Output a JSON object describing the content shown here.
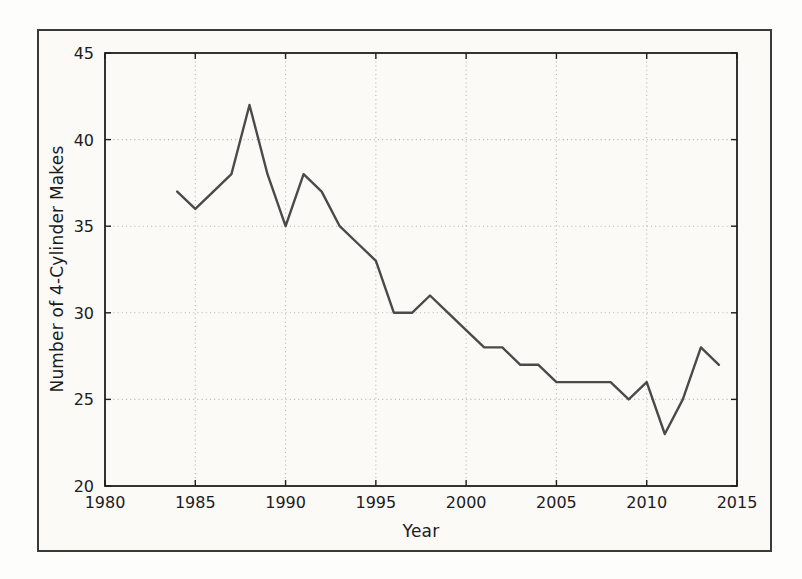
{
  "figure": {
    "page_color": "#fdfdfc",
    "paper_color": "#fbfaf7",
    "frame_color": "#3a3a3a"
  },
  "chart_data": {
    "type": "line",
    "title": "",
    "xlabel": "Year",
    "ylabel": "Number of 4-Cylinder Makes",
    "x": [
      1984,
      1985,
      1986,
      1987,
      1988,
      1989,
      1990,
      1991,
      1992,
      1993,
      1994,
      1995,
      1996,
      1997,
      1998,
      1999,
      2000,
      2001,
      2002,
      2003,
      2004,
      2005,
      2006,
      2007,
      2008,
      2009,
      2010,
      2011,
      2012,
      2013,
      2014
    ],
    "values": [
      37,
      36,
      37,
      38,
      42,
      38,
      35,
      38,
      37,
      35,
      34,
      33,
      30,
      30,
      31,
      30,
      29,
      28,
      28,
      27,
      27,
      26,
      26,
      26,
      26,
      25,
      26,
      23,
      25,
      28,
      27
    ],
    "xlim": [
      1980,
      2015
    ],
    "ylim": [
      20,
      45
    ],
    "xticks": [
      1980,
      1985,
      1990,
      1995,
      2000,
      2005,
      2010,
      2015
    ],
    "yticks": [
      20,
      25,
      30,
      35,
      40,
      45
    ],
    "grid": true,
    "grid_style": "dotted",
    "legend": "none",
    "line_color": "#4a4a4a",
    "grid_color": "#b3b3b3",
    "spine_color": "#1f1f1f",
    "tick_label_color": "#1c1c1c"
  }
}
